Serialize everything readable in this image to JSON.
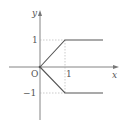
{
  "diagram": {
    "type": "piecewise function graph",
    "axes": {
      "x_label": "x",
      "y_label": "y",
      "origin_label": "O"
    },
    "ticks": {
      "x_one": "1",
      "y_one": "1",
      "y_minus_one": "−1"
    },
    "curves": [
      {
        "name": "upper-branch",
        "points": [
          [
            0,
            0
          ],
          [
            1,
            1
          ],
          [
            2.5,
            1
          ]
        ]
      },
      {
        "name": "lower-branch",
        "points": [
          [
            0,
            0
          ],
          [
            1,
            -1
          ],
          [
            2.5,
            -1
          ]
        ]
      }
    ],
    "colors": {
      "curve": "#555555",
      "axis": "#777777",
      "dashed": "#aaaaaa",
      "text": "#555555"
    }
  }
}
